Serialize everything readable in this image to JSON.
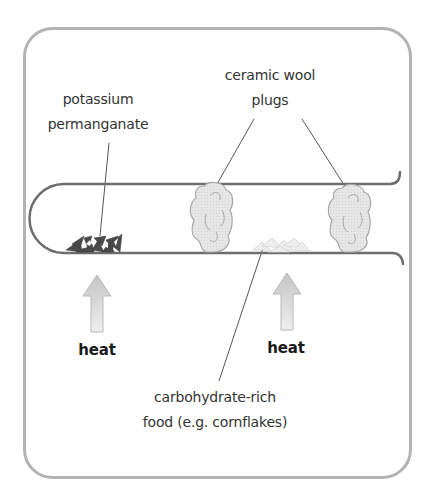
{
  "diagram": {
    "labels": {
      "potassium_line1": "potassium",
      "potassium_line2": "permanganate",
      "plugs_line1": "ceramic wool",
      "plugs_line2": "plugs",
      "heat_left": "heat",
      "heat_right": "heat",
      "food_line1": "carbohydrate-rich",
      "food_line2": "food (e.g. cornflakes)"
    },
    "colors": {
      "frame": "#b3b3b3",
      "tube": "#6e6e6e",
      "crystals": "#4a4a4a",
      "plug_fill": "#e4e4e4",
      "plug_stroke": "#a8a8a8",
      "arrow_top": "#c8c8c8",
      "arrow_bottom": "#ececec",
      "text": "#333333"
    },
    "components": [
      "frame",
      "test-tube",
      "potassium-permanganate-crystals",
      "ceramic-wool-plug-left",
      "ceramic-wool-plug-right",
      "cornflakes",
      "heat-arrow-left",
      "heat-arrow-right"
    ]
  }
}
